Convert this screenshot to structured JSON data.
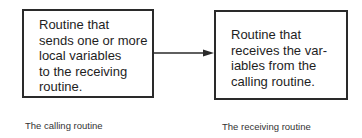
{
  "diagram": {
    "nodes": [
      {
        "id": "calling",
        "text": "Routine that\nsends one or more\nlocal variables\nto the receiving\nroutine.",
        "caption": "The calling routine"
      },
      {
        "id": "receiving",
        "text": "Routine that\nreceives the var-\niables from the\ncalling routine.",
        "caption": "The receiving routine"
      }
    ],
    "edges": [
      {
        "from": "calling",
        "to": "receiving",
        "type": "arrow"
      }
    ],
    "colors": {
      "stroke": "#2a2a2a",
      "text": "#1e1e1e",
      "background": "#ffffff"
    }
  }
}
